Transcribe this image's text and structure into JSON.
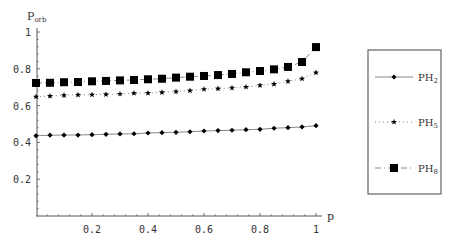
{
  "chart_data": {
    "type": "line",
    "title": "",
    "xlabel": "p",
    "ylabel": "P_orb",
    "ylabel_main": "P",
    "ylabel_sub": "orb",
    "xlim": [
      0,
      1
    ],
    "ylim": [
      0,
      1
    ],
    "grid": false,
    "legend_position": "right-outside",
    "x_ticks": [
      0.2,
      0.4,
      0.6,
      0.8,
      1
    ],
    "x_tick_labels": [
      "0.2",
      "0.4",
      "0.6",
      "0.8",
      "1"
    ],
    "y_ticks": [
      0.2,
      0.4,
      0.6,
      0.8,
      1
    ],
    "y_tick_labels": [
      "0.2",
      "0.4",
      "0.6",
      "0.8",
      "1"
    ],
    "x": [
      0,
      0.05,
      0.1,
      0.15,
      0.2,
      0.25,
      0.3,
      0.35,
      0.4,
      0.45,
      0.5,
      0.55,
      0.6,
      0.65,
      0.7,
      0.75,
      0.8,
      0.85,
      0.9,
      0.95,
      1.0
    ],
    "series": [
      {
        "name": "PH2",
        "label_main": "PH",
        "label_sub": "2",
        "marker": "diamond",
        "line_style": "solid",
        "values": [
          0.436,
          0.439,
          0.44,
          0.44,
          0.442,
          0.444,
          0.446,
          0.447,
          0.451,
          0.453,
          0.455,
          0.458,
          0.462,
          0.464,
          0.466,
          0.469,
          0.471,
          0.477,
          0.48,
          0.484,
          0.491
        ]
      },
      {
        "name": "PH5",
        "label_main": "PH",
        "label_sub": "5",
        "marker": "star",
        "line_style": "dotted",
        "values": [
          0.648,
          0.652,
          0.656,
          0.658,
          0.659,
          0.661,
          0.663,
          0.667,
          0.668,
          0.672,
          0.676,
          0.681,
          0.689,
          0.692,
          0.696,
          0.701,
          0.71,
          0.717,
          0.732,
          0.746,
          0.779
        ]
      },
      {
        "name": "PH8",
        "label_main": "PH",
        "label_sub": "8",
        "marker": "square",
        "line_style": "dashdot",
        "values": [
          0.723,
          0.724,
          0.727,
          0.728,
          0.732,
          0.734,
          0.737,
          0.739,
          0.743,
          0.746,
          0.752,
          0.757,
          0.761,
          0.766,
          0.772,
          0.781,
          0.788,
          0.797,
          0.81,
          0.837,
          0.918
        ]
      }
    ]
  },
  "colors": {
    "axis": "#555555",
    "series": "#000000",
    "line": "#888888",
    "legend_border": "#444444"
  }
}
